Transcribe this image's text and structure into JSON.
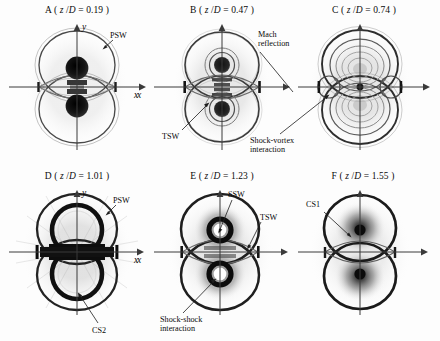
{
  "figure": {
    "axis_labels": {
      "x": "x",
      "y": "y"
    },
    "title_prefix_open": " ( ",
    "title_prefix_close": " )",
    "eq": " = ",
    "ratio_numerator": "z",
    "ratio_slash": "/",
    "ratio_denominator": "D"
  },
  "panels": [
    {
      "letter": "A",
      "title": "A ( z /D = 0.19 )",
      "zD": "0.19",
      "axis_x": "x",
      "axis_y": "y",
      "annotations": [
        {
          "name": "psw",
          "text": "PSW"
        }
      ]
    },
    {
      "letter": "B",
      "title": "B ( z /D = 0.47 )",
      "zD": "0.47",
      "axis_x": "x",
      "axis_y": "",
      "annotations": [
        {
          "name": "mach-reflection",
          "text": "Mach\nreflection"
        },
        {
          "name": "tsw",
          "text": "TSW"
        }
      ]
    },
    {
      "letter": "C",
      "title": "C ( z /D = 0.74 )",
      "zD": "0.74",
      "axis_x": "",
      "axis_y": "",
      "annotations": [
        {
          "name": "shock-vortex-interaction",
          "text": "Shock-vortex\ninteraction"
        }
      ]
    },
    {
      "letter": "D",
      "title": "D ( z /D = 1.01 )",
      "zD": "1.01",
      "axis_x": "x",
      "axis_y": "y",
      "annotations": [
        {
          "name": "psw",
          "text": "PSW"
        },
        {
          "name": "cs2",
          "text": "CS2"
        }
      ]
    },
    {
      "letter": "E",
      "title": "E ( z /D = 1.23 )",
      "zD": "1.23",
      "axis_x": "x",
      "axis_y": "",
      "annotations": [
        {
          "name": "ssw",
          "text": "SSW"
        },
        {
          "name": "tsw",
          "text": "TSW"
        },
        {
          "name": "shock-shock-interaction",
          "text": "Shock-shock\ninteraction"
        }
      ]
    },
    {
      "letter": "F",
      "title": "F ( z /D = 1.55 )",
      "zD": "1.55",
      "axis_x": "",
      "axis_y": "",
      "annotations": [
        {
          "name": "cs1",
          "text": "CS1"
        }
      ]
    }
  ],
  "colors": {
    "axis": "#3a3a3a",
    "shock_dark": "#1a1a1a",
    "shock_mid": "#6b6b6b",
    "shock_light": "#b9b9b9",
    "background": "#fdfdfd"
  }
}
